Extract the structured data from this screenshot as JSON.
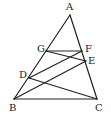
{
  "diagram": {
    "points": {
      "A": {
        "label": "A",
        "x": 70,
        "y": 15,
        "lx": 66,
        "ly": 10
      },
      "B": {
        "label": "B",
        "x": 14,
        "y": 99,
        "lx": 9,
        "ly": 111
      },
      "C": {
        "label": "C",
        "x": 97,
        "y": 99,
        "lx": 95,
        "ly": 111
      },
      "D": {
        "label": "D",
        "x": 29,
        "y": 78,
        "lx": 19,
        "ly": 78
      },
      "E": {
        "label": "E",
        "x": 86,
        "y": 61,
        "lx": 88,
        "ly": 64
      },
      "F": {
        "label": "F",
        "x": 82,
        "y": 51,
        "lx": 85,
        "ly": 52
      },
      "G": {
        "label": "G",
        "x": 46,
        "y": 51,
        "lx": 37,
        "ly": 52
      }
    },
    "segments": [
      "AB",
      "AC",
      "BC",
      "GF",
      "GE",
      "DF",
      "DC",
      "BE"
    ],
    "stroke_color": "#222222"
  }
}
